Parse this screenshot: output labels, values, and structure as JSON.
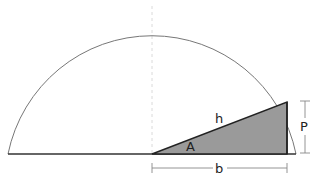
{
  "diagram": {
    "labels": {
      "hypotenuse": "h",
      "angle": "A",
      "base": "b",
      "perpendicular": "P"
    },
    "colors": {
      "triangle_fill": "#9a9a9a",
      "stroke": "#333333",
      "arc": "#777777",
      "centerline": "#cccccc"
    }
  }
}
